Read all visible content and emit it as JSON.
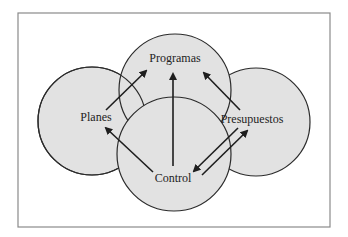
{
  "diagram": {
    "type": "overlapping-circles",
    "colors": {
      "circle_fill": "#e2e2e2",
      "stroke": "#2b2b2b",
      "frame": "#8a8a8a",
      "background": "#ffffff"
    },
    "nodes": [
      {
        "id": "programas",
        "label": "Programas"
      },
      {
        "id": "planes",
        "label": "Planes"
      },
      {
        "id": "presupuestos",
        "label": "Presupuestos"
      },
      {
        "id": "control",
        "label": "Control"
      }
    ],
    "edges": [
      {
        "from": "planes",
        "to": "programas"
      },
      {
        "from": "control",
        "to": "programas"
      },
      {
        "from": "presupuestos",
        "to": "programas"
      },
      {
        "from": "control",
        "to": "planes"
      },
      {
        "from": "presupuestos",
        "to": "control"
      },
      {
        "from": "control",
        "to": "presupuestos"
      }
    ]
  }
}
